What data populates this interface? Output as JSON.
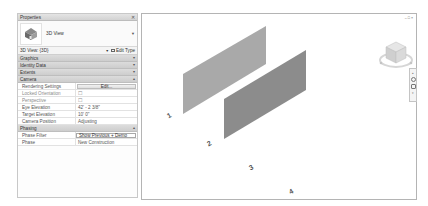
{
  "properties": {
    "title": "Properties",
    "type_selector": {
      "name": "3D View",
      "icon": "3d-view-house-icon"
    },
    "view_dropdown": {
      "selected": "3D View: {3D}",
      "edit_type_label": "Edit Type"
    },
    "groups": {
      "graphics": "Graphics",
      "identity_data": "Identity Data",
      "extents": "Extents",
      "camera": "Camera",
      "phasing": "Phasing"
    },
    "camera_rows": [
      {
        "key": "Rendering Settings",
        "value": "Edit...",
        "type": "button"
      },
      {
        "key": "Locked Orientation",
        "value": "☐",
        "type": "checkbox"
      },
      {
        "key": "Perspective",
        "value": "☐",
        "type": "checkbox"
      },
      {
        "key": "Eye Elevation",
        "value": "42' - 2 3/8\"",
        "type": "text"
      },
      {
        "key": "Target Elevation",
        "value": "10' 0\"",
        "type": "text"
      },
      {
        "key": "Camera Position",
        "value": "Adjusting",
        "type": "text"
      }
    ],
    "phasing_rows": [
      {
        "key": "Phase Filter",
        "value": "Show Previous + Demo",
        "type": "select"
      },
      {
        "key": "Phase",
        "value": "New Construction",
        "type": "select"
      }
    ]
  },
  "viewport": {
    "window_controls": [
      "–",
      "□",
      "×"
    ],
    "grid_labels": [
      "1",
      "2",
      "3",
      "4"
    ],
    "walls": [
      {
        "name": "wall-1",
        "color": "#a9a9a9"
      },
      {
        "name": "wall-2",
        "color": "#8c8c8c"
      }
    ],
    "viewcube": {
      "face": "TOP"
    }
  }
}
